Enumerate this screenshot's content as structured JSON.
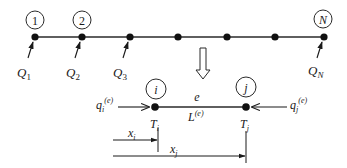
{
  "diagram": {
    "type": "finite-element-mesh-1d",
    "global_mesh": {
      "node_count_visible": 7,
      "numbered_nodes": [
        {
          "id": "node-1",
          "label": "1"
        },
        {
          "id": "node-2",
          "label": "2"
        },
        {
          "id": "node-N",
          "label": "N"
        }
      ],
      "loads": [
        {
          "symbol": "Q",
          "subscript": "1"
        },
        {
          "symbol": "Q",
          "subscript": "2"
        },
        {
          "symbol": "Q",
          "subscript": "3"
        },
        {
          "symbol": "Q",
          "subscript": "N"
        }
      ]
    },
    "transition_arrow": "hollow-down-arrow",
    "element": {
      "label": "e",
      "length_symbol": "L",
      "length_superscript": "(e)",
      "node_i": {
        "label": "i",
        "temp_symbol": "T",
        "temp_subscript": "i",
        "flux_symbol": "q",
        "flux_subscript": "i",
        "flux_superscript": "(e)"
      },
      "node_j": {
        "label": "j",
        "temp_symbol": "T",
        "temp_subscript": "j",
        "flux_symbol": "q",
        "flux_subscript": "j",
        "flux_superscript": "(e)"
      },
      "coord_i": {
        "symbol": "x",
        "subscript": "i"
      },
      "coord_j": {
        "symbol": "x",
        "subscript": "j"
      }
    },
    "colors": {
      "line": "#2a2a2a",
      "node": "#111111",
      "background": "#ffffff"
    }
  }
}
